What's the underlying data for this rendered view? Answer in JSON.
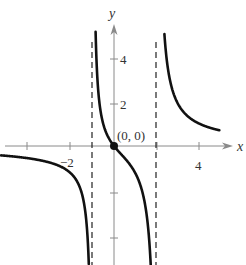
{
  "chart_data": {
    "type": "line",
    "title": "",
    "xlabel": "x",
    "ylabel": "y",
    "xlim": [
      -5.2,
      5.3
    ],
    "ylim": [
      -5.2,
      5.5
    ],
    "x_ticks": [
      -4,
      -2,
      2,
      4
    ],
    "x_tick_labels": [
      "-2",
      "4"
    ],
    "y_ticks": [
      -4,
      -2,
      2,
      4
    ],
    "y_tick_labels": [
      "2",
      "4"
    ],
    "grid": false,
    "vertical_asymptotes": [
      -1,
      2
    ],
    "horizontal_asymptote": 0,
    "annotations": [
      {
        "text": "(0, 0)",
        "x": 0,
        "y": 0,
        "marker": "filled-circle"
      }
    ],
    "series": [
      {
        "name": "left-branch",
        "points": [
          [
            -5.2,
            -0.6
          ],
          [
            -4,
            -0.83
          ],
          [
            -3,
            -1.25
          ],
          [
            -2,
            -1.25
          ],
          [
            -1.5,
            -2.1
          ],
          [
            -1.2,
            -4.2
          ],
          [
            -1.1,
            -5.2
          ]
        ]
      },
      {
        "name": "middle-branch",
        "points": [
          [
            -0.85,
            5.0
          ],
          [
            -0.7,
            2.5
          ],
          [
            -0.4,
            0.8
          ],
          [
            0,
            0
          ],
          [
            0.5,
            -0.6
          ],
          [
            1,
            -1.25
          ],
          [
            1.5,
            -2.5
          ],
          [
            1.8,
            -4.8
          ]
        ]
      },
      {
        "name": "right-branch",
        "points": [
          [
            2.4,
            5.2
          ],
          [
            2.7,
            3.0
          ],
          [
            3,
            1.9
          ],
          [
            3.5,
            1.3
          ],
          [
            4,
            1.0
          ],
          [
            4.9,
            0.73
          ]
        ]
      }
    ]
  },
  "labels": {
    "x_axis": "x",
    "y_axis": "y",
    "x_neg2": "−2",
    "x_4": "4",
    "y_2": "2",
    "y_4": "4",
    "origin": "(0, 0)"
  },
  "colors": {
    "axis": "#8a8a8a",
    "curve": "#111111",
    "asymptote": "#222222"
  }
}
